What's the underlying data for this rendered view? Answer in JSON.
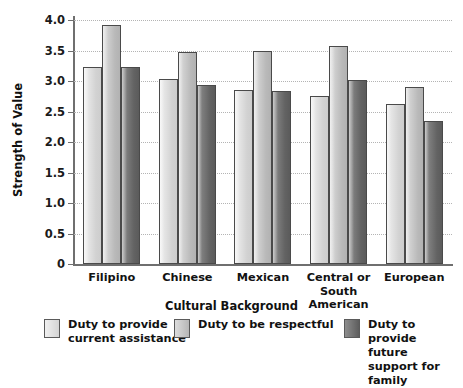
{
  "chart_data": {
    "type": "bar",
    "title": "",
    "xlabel": "Cultural Background",
    "ylabel": "Strength of Value",
    "categories": [
      "Filipino",
      "Chinese",
      "Mexican",
      "Central or South American",
      "European"
    ],
    "series": [
      {
        "name": "Duty to provide current assistance",
        "values": [
          3.23,
          3.03,
          2.85,
          2.76,
          2.62
        ]
      },
      {
        "name": "Duty to be respectful",
        "values": [
          3.92,
          3.48,
          3.5,
          3.57,
          2.9
        ]
      },
      {
        "name": "Duty to provide future support for family",
        "values": [
          3.23,
          2.93,
          2.84,
          3.01,
          2.34
        ]
      }
    ],
    "ylim": [
      0,
      4.0
    ],
    "yticks": [
      "0",
      "0.5",
      "1.0",
      "1.5",
      "2.0",
      "2.5",
      "3.0",
      "3.5",
      "4.0"
    ],
    "ytick_values": [
      0,
      0.5,
      1.0,
      1.5,
      2.0,
      2.5,
      3.0,
      3.5,
      4.0
    ],
    "grid": true,
    "legend_position": "bottom",
    "colors": {
      "series_1": "#e3e3e3",
      "series_2": "#c6c6c6",
      "series_3": "#6f6f6f",
      "gridline": "#b4b4b4",
      "axis": "#6f6f6f",
      "text": "#111111",
      "background": "#ffffff"
    }
  },
  "legend": {
    "items": [
      {
        "label": "Duty to provide\ncurrent assistance",
        "swatch": "series_1"
      },
      {
        "label": "Duty to be respectful",
        "swatch": "series_2"
      },
      {
        "label": "Duty to provide future\nsupport for family",
        "swatch": "series_3"
      }
    ]
  },
  "category_labels": [
    "Filipino",
    "Chinese",
    "Mexican",
    "Central or South\nAmerican",
    "European"
  ]
}
